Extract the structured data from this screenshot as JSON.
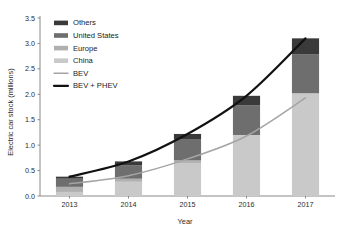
{
  "chart_data": {
    "type": "bar",
    "title": "",
    "subtitle": "",
    "xlabel": "Year",
    "ylabel": "Electric car stock (millions)",
    "categories": [
      "2013",
      "2014",
      "2015",
      "2016",
      "2017"
    ],
    "xlim": [
      2012.5,
      2017.5
    ],
    "ylim": [
      0.0,
      3.5
    ],
    "yticks": [
      "0.0",
      "0.5",
      "1.0",
      "1.5",
      "2.0",
      "2.5",
      "3.0",
      "3.5"
    ],
    "ytick_values": [
      0.0,
      0.5,
      1.0,
      1.5,
      2.0,
      2.5,
      3.0,
      3.5
    ],
    "grid": false,
    "legend_position": "upper left",
    "stacked": true,
    "stack_order_bottom_to_top": [
      "China",
      "Europe",
      "United States",
      "Others"
    ],
    "series": [
      {
        "name": "China",
        "kind": "bar",
        "color": "#c9c9c9",
        "values": [
          0.08,
          0.28,
          0.65,
          1.2,
          2.02
        ]
      },
      {
        "name": "Europe",
        "kind": "bar",
        "color": "#b0b0b0",
        "values": [
          0.1,
          0.06,
          0.05,
          0.0,
          0.0
        ]
      },
      {
        "name": "United States",
        "kind": "bar",
        "color": "#6e6e6e",
        "values": [
          0.16,
          0.26,
          0.42,
          0.58,
          0.77
        ]
      },
      {
        "name": "Others",
        "kind": "bar",
        "color": "#3a3a3a",
        "values": [
          0.04,
          0.08,
          0.1,
          0.19,
          0.31
        ]
      },
      {
        "name": "BEV",
        "kind": "line",
        "color": "#a5a5a5",
        "values": [
          0.24,
          0.4,
          0.73,
          1.18,
          1.93
        ]
      },
      {
        "name": "BEV + PHEV",
        "kind": "line",
        "color": "#111111",
        "values": [
          0.38,
          0.68,
          1.22,
          1.97,
          3.1
        ]
      }
    ],
    "bar_totals": [
      0.38,
      0.68,
      1.22,
      1.97,
      3.1
    ],
    "legend_entries": [
      {
        "label": "Others",
        "swatch": "bar",
        "color": "#3a3a3a"
      },
      {
        "label": "United States",
        "swatch": "bar",
        "color": "#6e6e6e"
      },
      {
        "label": "Europe",
        "swatch": "bar",
        "color": "#b0b0b0"
      },
      {
        "label": "China",
        "swatch": "bar",
        "color": "#c9c9c9"
      },
      {
        "label": "BEV",
        "swatch": "line",
        "color": "#a5a5a5"
      },
      {
        "label": "BEV + PHEV",
        "swatch": "line",
        "color": "#111111"
      }
    ]
  },
  "colors": {
    "axis": "#8a8a8a",
    "text": "#2b2b2b",
    "background": "#ffffff"
  }
}
